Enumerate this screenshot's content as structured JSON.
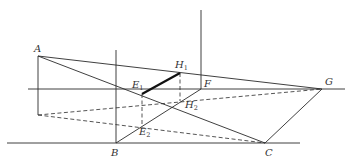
{
  "diagram": {
    "type": "perspective-geometry",
    "stroke_color": "#2a2a2a",
    "points": {
      "A": {
        "label": "A",
        "x": 38,
        "y": 56
      },
      "B": {
        "label": "B",
        "x": 116,
        "y": 143
      },
      "C": {
        "label": "C",
        "x": 265,
        "y": 143
      },
      "F": {
        "label": "F",
        "x": 201,
        "y": 89
      },
      "G": {
        "label": "G",
        "x": 322,
        "y": 89
      },
      "H1": {
        "label": "H",
        "sub": "1",
        "x": 180,
        "y": 73
      },
      "H2": {
        "label": "H",
        "sub": "2",
        "x": 176,
        "y": 102
      },
      "E1": {
        "label": "E",
        "sub": "1",
        "x": 142,
        "y": 94
      },
      "E2": {
        "label": "E",
        "sub": "2",
        "x": 141,
        "y": 126
      }
    },
    "labels": {
      "A": "A",
      "B": "B",
      "C": "C",
      "F": "F",
      "G": "G",
      "H1_main": "H",
      "H1_sub": "1",
      "H2_main": "H",
      "H2_sub": "2",
      "E1_main": "E",
      "E1_sub": "1",
      "E2_main": "E",
      "E2_sub": "2"
    }
  }
}
